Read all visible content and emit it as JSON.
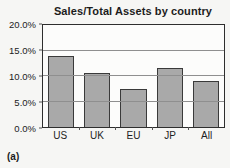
{
  "figure_label": "(a)",
  "chart_data": {
    "type": "bar",
    "title": "Sales/Total Assets by country",
    "categories": [
      "US",
      "UK",
      "EU",
      "JP",
      "All"
    ],
    "values": [
      14.0,
      10.5,
      7.5,
      11.5,
      9.0
    ],
    "ylim": [
      0,
      20
    ],
    "y_ticks": [
      0,
      5,
      10,
      15,
      20
    ],
    "y_tick_labels": [
      "0.0%",
      "5.0%",
      "10.0%",
      "15.0%",
      "20.0%"
    ],
    "xlabel": "",
    "ylabel": "",
    "grid": true,
    "legend": false,
    "bar_fill_color": "#a9a9a9",
    "bar_border_color": "#3a3a3a"
  }
}
